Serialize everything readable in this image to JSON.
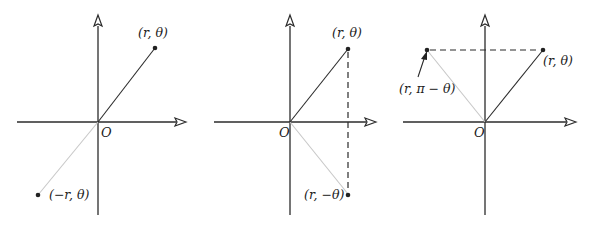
{
  "figure": {
    "panels": [
      {
        "name": "negative-radius",
        "origin_label": "O",
        "points": [
          {
            "label": "(r, θ)"
          },
          {
            "label": "(−r, θ)"
          }
        ]
      },
      {
        "name": "negative-angle",
        "origin_label": "O",
        "points": [
          {
            "label": "(r, θ)"
          },
          {
            "label": "(r, −θ)"
          }
        ]
      },
      {
        "name": "supplementary-angle",
        "origin_label": "O",
        "points": [
          {
            "label": "(r, θ)"
          },
          {
            "label": "(r, π − θ)"
          }
        ]
      }
    ],
    "colors": {
      "ink": "#2b2b2b",
      "faint_ray": "#c8c8c8",
      "background": "#ffffff"
    }
  }
}
